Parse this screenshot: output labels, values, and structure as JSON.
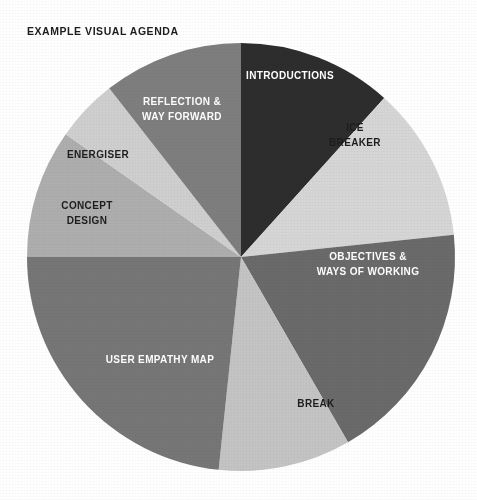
{
  "title": "EXAMPLE VISUAL AGENDA",
  "background_color": "#ffffff",
  "title_color": "#1d1d1d",
  "chart_data": {
    "type": "pie",
    "title": "EXAMPLE VISUAL AGENDA",
    "xlabel": "",
    "ylabel": "",
    "legend": "none",
    "grid": false,
    "start_angle_deg": 0,
    "direction": "clockwise",
    "center": {
      "x": 241,
      "y": 257
    },
    "radius": 214,
    "total_value": 100,
    "categories": [
      "INTRODUCTIONS",
      "ICE BREAKER",
      "OBJECTIVES & WAYS OF WORKING",
      "BREAK",
      "USER EMPATHY MAP",
      "CONCEPT DESIGN",
      "ENERGISER",
      "REFLECTION & WAY FORWARD"
    ],
    "values": [
      11.7,
      11.7,
      18.3,
      10.0,
      23.3,
      9.7,
      4.7,
      10.6
    ],
    "slices": [
      {
        "label": "INTRODUCTIONS",
        "label_lines": [
          "INTRODUCTIONS"
        ],
        "value": 11.7,
        "start_angle": 0,
        "end_angle": 42,
        "color": "#2d2d2d",
        "text_color": "#ffffff",
        "font_size": 10,
        "label_x": 290,
        "label_y": 76
      },
      {
        "label": "ICE BREAKER",
        "label_lines": [
          "ICE",
          "BREAKER"
        ],
        "value": 11.7,
        "start_angle": 42,
        "end_angle": 84,
        "color": "#d6d6d6",
        "text_color": "#1d1d1d",
        "font_size": 10,
        "label_x": 355,
        "label_y": 135
      },
      {
        "label": "OBJECTIVES & WAYS OF WORKING",
        "label_lines": [
          "OBJECTIVES &",
          "WAYS OF WORKING"
        ],
        "value": 18.3,
        "start_angle": 84,
        "end_angle": 150,
        "color": "#6a6a6a",
        "text_color": "#ffffff",
        "font_size": 10,
        "label_x": 368,
        "label_y": 264
      },
      {
        "label": "BREAK",
        "label_lines": [
          "BREAK"
        ],
        "value": 10.0,
        "start_angle": 150,
        "end_angle": 186,
        "color": "#c4c4c4",
        "text_color": "#1d1d1d",
        "font_size": 10,
        "label_x": 316,
        "label_y": 404
      },
      {
        "label": "USER EMPATHY MAP",
        "label_lines": [
          "USER EMPATHY MAP"
        ],
        "value": 23.3,
        "start_angle": 186,
        "end_angle": 270,
        "color": "#767676",
        "text_color": "#ffffff",
        "font_size": 10,
        "label_x": 160,
        "label_y": 360
      },
      {
        "label": "CONCEPT DESIGN",
        "label_lines": [
          "CONCEPT",
          "DESIGN"
        ],
        "value": 9.7,
        "start_angle": 270,
        "end_angle": 305,
        "color": "#aeaeae",
        "text_color": "#1d1d1d",
        "font_size": 10,
        "label_x": 87,
        "label_y": 213
      },
      {
        "label": "ENERGISER",
        "label_lines": [
          "ENERGISER"
        ],
        "value": 4.7,
        "start_angle": 305,
        "end_angle": 322,
        "color": "#cfcfcf",
        "text_color": "#1d1d1d",
        "font_size": 10,
        "label_x": 98,
        "label_y": 155
      },
      {
        "label": "REFLECTION & WAY FORWARD",
        "label_lines": [
          "REFLECTION &",
          "WAY FORWARD"
        ],
        "value": 10.6,
        "start_angle": 322,
        "end_angle": 360,
        "color": "#7e7e7e",
        "text_color": "#ffffff",
        "font_size": 10,
        "label_x": 182,
        "label_y": 109
      }
    ]
  }
}
